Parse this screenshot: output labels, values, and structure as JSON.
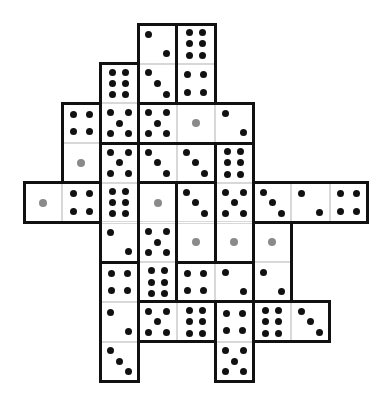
{
  "puzzle": {
    "type": "dice-polyomino-grid",
    "grid": {
      "cols": 9,
      "rows": 9,
      "origin_x": 24,
      "origin_y": 24,
      "cell_w": 38.2,
      "cell_h": 39.7
    },
    "colors": {
      "pip": "#111111",
      "single_pip": "#8a8a8a",
      "border": "#111111",
      "grid_line": "#d8d8d8"
    },
    "cells": [
      {
        "c": 3,
        "r": 0,
        "v": 2
      },
      {
        "c": 4,
        "r": 0,
        "v": 6
      },
      {
        "c": 2,
        "r": 1,
        "v": 6
      },
      {
        "c": 3,
        "r": 1,
        "v": 3
      },
      {
        "c": 4,
        "r": 1,
        "v": 4
      },
      {
        "c": 1,
        "r": 2,
        "v": 4
      },
      {
        "c": 2,
        "r": 2,
        "v": 5
      },
      {
        "c": 3,
        "r": 2,
        "v": 5
      },
      {
        "c": 4,
        "r": 2,
        "v": 1
      },
      {
        "c": 5,
        "r": 2,
        "v": 2
      },
      {
        "c": 1,
        "r": 3,
        "v": 1
      },
      {
        "c": 2,
        "r": 3,
        "v": 5
      },
      {
        "c": 3,
        "r": 3,
        "v": 3
      },
      {
        "c": 4,
        "r": 3,
        "v": 3
      },
      {
        "c": 5,
        "r": 3,
        "v": 6
      },
      {
        "c": 0,
        "r": 4,
        "v": 1
      },
      {
        "c": 1,
        "r": 4,
        "v": 4
      },
      {
        "c": 2,
        "r": 4,
        "v": 6
      },
      {
        "c": 3,
        "r": 4,
        "v": 1
      },
      {
        "c": 4,
        "r": 4,
        "v": 3
      },
      {
        "c": 5,
        "r": 4,
        "v": 5
      },
      {
        "c": 6,
        "r": 4,
        "v": 3
      },
      {
        "c": 7,
        "r": 4,
        "v": 2
      },
      {
        "c": 8,
        "r": 4,
        "v": 4
      },
      {
        "c": 2,
        "r": 5,
        "v": 2
      },
      {
        "c": 3,
        "r": 5,
        "v": 5
      },
      {
        "c": 4,
        "r": 5,
        "v": 1
      },
      {
        "c": 5,
        "r": 5,
        "v": 1
      },
      {
        "c": 6,
        "r": 5,
        "v": 1
      },
      {
        "c": 2,
        "r": 6,
        "v": 4
      },
      {
        "c": 3,
        "r": 6,
        "v": 6
      },
      {
        "c": 4,
        "r": 6,
        "v": 4
      },
      {
        "c": 5,
        "r": 6,
        "v": 2
      },
      {
        "c": 6,
        "r": 6,
        "v": 2
      },
      {
        "c": 2,
        "r": 7,
        "v": 2
      },
      {
        "c": 3,
        "r": 7,
        "v": 5
      },
      {
        "c": 4,
        "r": 7,
        "v": 6
      },
      {
        "c": 5,
        "r": 7,
        "v": 4
      },
      {
        "c": 6,
        "r": 7,
        "v": 6
      },
      {
        "c": 7,
        "r": 7,
        "v": 3
      },
      {
        "c": 2,
        "r": 8,
        "v": 3
      },
      {
        "c": 5,
        "r": 8,
        "v": 5
      }
    ],
    "pieces": [
      [
        [
          3,
          0
        ],
        [
          3,
          1
        ]
      ],
      [
        [
          4,
          0
        ],
        [
          4,
          1
        ]
      ],
      [
        [
          2,
          1
        ],
        [
          2,
          2
        ]
      ],
      [
        [
          1,
          2
        ],
        [
          1,
          3
        ]
      ],
      [
        [
          3,
          2
        ],
        [
          4,
          2
        ],
        [
          5,
          2
        ]
      ],
      [
        [
          3,
          3
        ],
        [
          4,
          3
        ]
      ],
      [
        [
          2,
          3
        ],
        [
          2,
          4
        ],
        [
          2,
          5
        ]
      ],
      [
        [
          5,
          3
        ],
        [
          5,
          4
        ],
        [
          5,
          5
        ]
      ],
      [
        [
          4,
          4
        ],
        [
          4,
          5
        ]
      ],
      [
        [
          3,
          4
        ],
        [
          3,
          5
        ],
        [
          3,
          6
        ]
      ],
      [
        [
          0,
          4
        ],
        [
          1,
          4
        ]
      ],
      [
        [
          6,
          4
        ],
        [
          7,
          4
        ],
        [
          8,
          4
        ]
      ],
      [
        [
          6,
          5
        ],
        [
          6,
          6
        ]
      ],
      [
        [
          2,
          6
        ],
        [
          2,
          7
        ],
        [
          2,
          8
        ]
      ],
      [
        [
          4,
          6
        ],
        [
          5,
          6
        ]
      ],
      [
        [
          3,
          7
        ],
        [
          4,
          7
        ]
      ],
      [
        [
          5,
          7
        ],
        [
          5,
          8
        ]
      ],
      [
        [
          6,
          7
        ],
        [
          7,
          7
        ]
      ]
    ]
  }
}
